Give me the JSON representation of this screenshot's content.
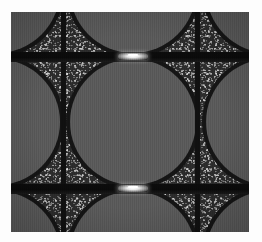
{
  "image": {
    "kind": "grayscale-micrograph",
    "title": "Periodic particle lattice micrograph",
    "width_px": 262,
    "height_px": 242,
    "border": {
      "color": "#fdfdfd",
      "inset_left_px": 11,
      "inset_top_px": 12
    },
    "frame": {
      "left_px": 11,
      "top_px": 12,
      "width_px": 238,
      "height_px": 220
    },
    "palette": {
      "background_white": "#fdfdfd",
      "matrix_gray": "#565656",
      "particle_gray": "#5a5a5a",
      "boundary_black": "#101010",
      "speckle_dark": "#2c2c2c",
      "neck_highlight": "#ffffff"
    },
    "structure": {
      "lattice_pitch_x_px": 136,
      "lattice_pitch_y_px": 132,
      "particle_radius_px": 63,
      "boundary_line_width_px": 5,
      "band_height_px": 10
    },
    "particles": [
      {
        "name": "particle-center",
        "cx": 122,
        "cy": 110,
        "r": 63
      },
      {
        "name": "particle-top-left",
        "cx": -14,
        "cy": -22,
        "r": 63
      },
      {
        "name": "particle-top-center",
        "cx": 122,
        "cy": -22,
        "r": 63
      },
      {
        "name": "particle-top-right",
        "cx": 258,
        "cy": -22,
        "r": 63
      },
      {
        "name": "particle-mid-left",
        "cx": -14,
        "cy": 110,
        "r": 63
      },
      {
        "name": "particle-mid-right",
        "cx": 258,
        "cy": 110,
        "r": 63
      },
      {
        "name": "particle-bottom-left",
        "cx": -14,
        "cy": 242,
        "r": 63
      },
      {
        "name": "particle-bottom-center",
        "cx": 122,
        "cy": 242,
        "r": 63
      },
      {
        "name": "particle-bottom-right",
        "cx": 258,
        "cy": 242,
        "r": 63
      }
    ],
    "grain_boundaries": {
      "vertical_x_px": [
        52,
        186
      ],
      "horizontal_band_y_px": [
        42,
        174
      ]
    },
    "necks": [
      {
        "name": "neck-upper",
        "cx": 122,
        "cy": 44,
        "width_px": 30
      },
      {
        "name": "neck-lower",
        "cx": 122,
        "cy": 176,
        "width_px": 30
      }
    ],
    "texture": {
      "type": "speckled-grain",
      "stripe_orientation": "vertical",
      "notes": "fine vertical column striping across the whole field"
    }
  }
}
